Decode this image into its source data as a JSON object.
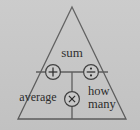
{
  "diagram": {
    "kind": "math-relationship-triangle",
    "title_text": "sum",
    "labels": {
      "top": "sum",
      "bottom_left": "average",
      "bottom_right_line1": "how",
      "bottom_right_line2": "many"
    },
    "operators": [
      {
        "name": "plus",
        "glyph": "+",
        "position": "upper-left-crossbar"
      },
      {
        "name": "divide",
        "glyph": "÷",
        "position": "upper-right-crossbar"
      },
      {
        "name": "times",
        "glyph": "×",
        "position": "lower-vertical-bar"
      }
    ],
    "colors": {
      "background": "#c9c9c9",
      "line": "#5a5a5a",
      "text": "#2b2b2b",
      "circle_fill": "#cdcdcd"
    },
    "geometry": {
      "apex": [
        72,
        7
      ],
      "base_left": [
        18,
        119
      ],
      "base_right": [
        126,
        119
      ],
      "crossbar_y": 72,
      "crossbar_x_start": 36,
      "crossbar_x_end": 108,
      "vertical_x": 72,
      "vertical_y_start": 72,
      "vertical_y_end": 119,
      "circle_radius": 7.5
    }
  }
}
